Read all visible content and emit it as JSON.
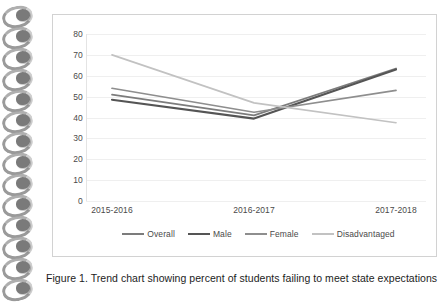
{
  "document": {
    "caption": "Figure 1. Trend chart showing percent of students failing to meet state expectations",
    "top_artifact_text": ""
  },
  "chart_data": {
    "type": "line",
    "title": "",
    "xlabel": "",
    "ylabel": "",
    "categories": [
      "2015-2016",
      "2016-2017",
      "2017-2018"
    ],
    "ylim": [
      0,
      80
    ],
    "yticks": [
      80,
      70,
      60,
      50,
      40,
      30,
      20,
      10,
      0
    ],
    "grid": true,
    "legend_position": "bottom",
    "series": [
      {
        "name": "Overall",
        "values": [
          51,
          41,
          63.5
        ],
        "color": "#7c7c7c"
      },
      {
        "name": "Male",
        "values": [
          48.5,
          39.5,
          63
        ],
        "color": "#555555"
      },
      {
        "name": "Female",
        "values": [
          54,
          42.5,
          53
        ],
        "color": "#8e8e8e"
      },
      {
        "name": "Disadvantaged",
        "values": [
          70,
          47,
          37.5
        ],
        "color": "#c2c2c2"
      }
    ]
  },
  "legend": {
    "items": [
      {
        "label": "Overall",
        "color": "#7c7c7c"
      },
      {
        "label": "Male",
        "color": "#555555"
      },
      {
        "label": "Female",
        "color": "#8e8e8e"
      },
      {
        "label": "Disadvantaged",
        "color": "#c2c2c2"
      }
    ]
  },
  "binding": {
    "coil_count": 14
  }
}
